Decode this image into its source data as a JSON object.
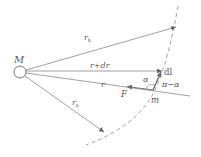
{
  "diagram": {
    "title": "",
    "colors": {
      "line": "#777777",
      "text": "#555555",
      "dashed": "#888888",
      "background": "#ffffff"
    },
    "labels": {
      "mass_center": "M",
      "r_b": "r",
      "r_b_sub": "b",
      "r_plus_dr": "r+dr",
      "r": "r",
      "force": "F",
      "dl": "dl",
      "alpha": "α",
      "pi_minus_alpha": "π−α",
      "small_mass": "m",
      "r_a": "r",
      "r_a_sub": "a"
    }
  }
}
